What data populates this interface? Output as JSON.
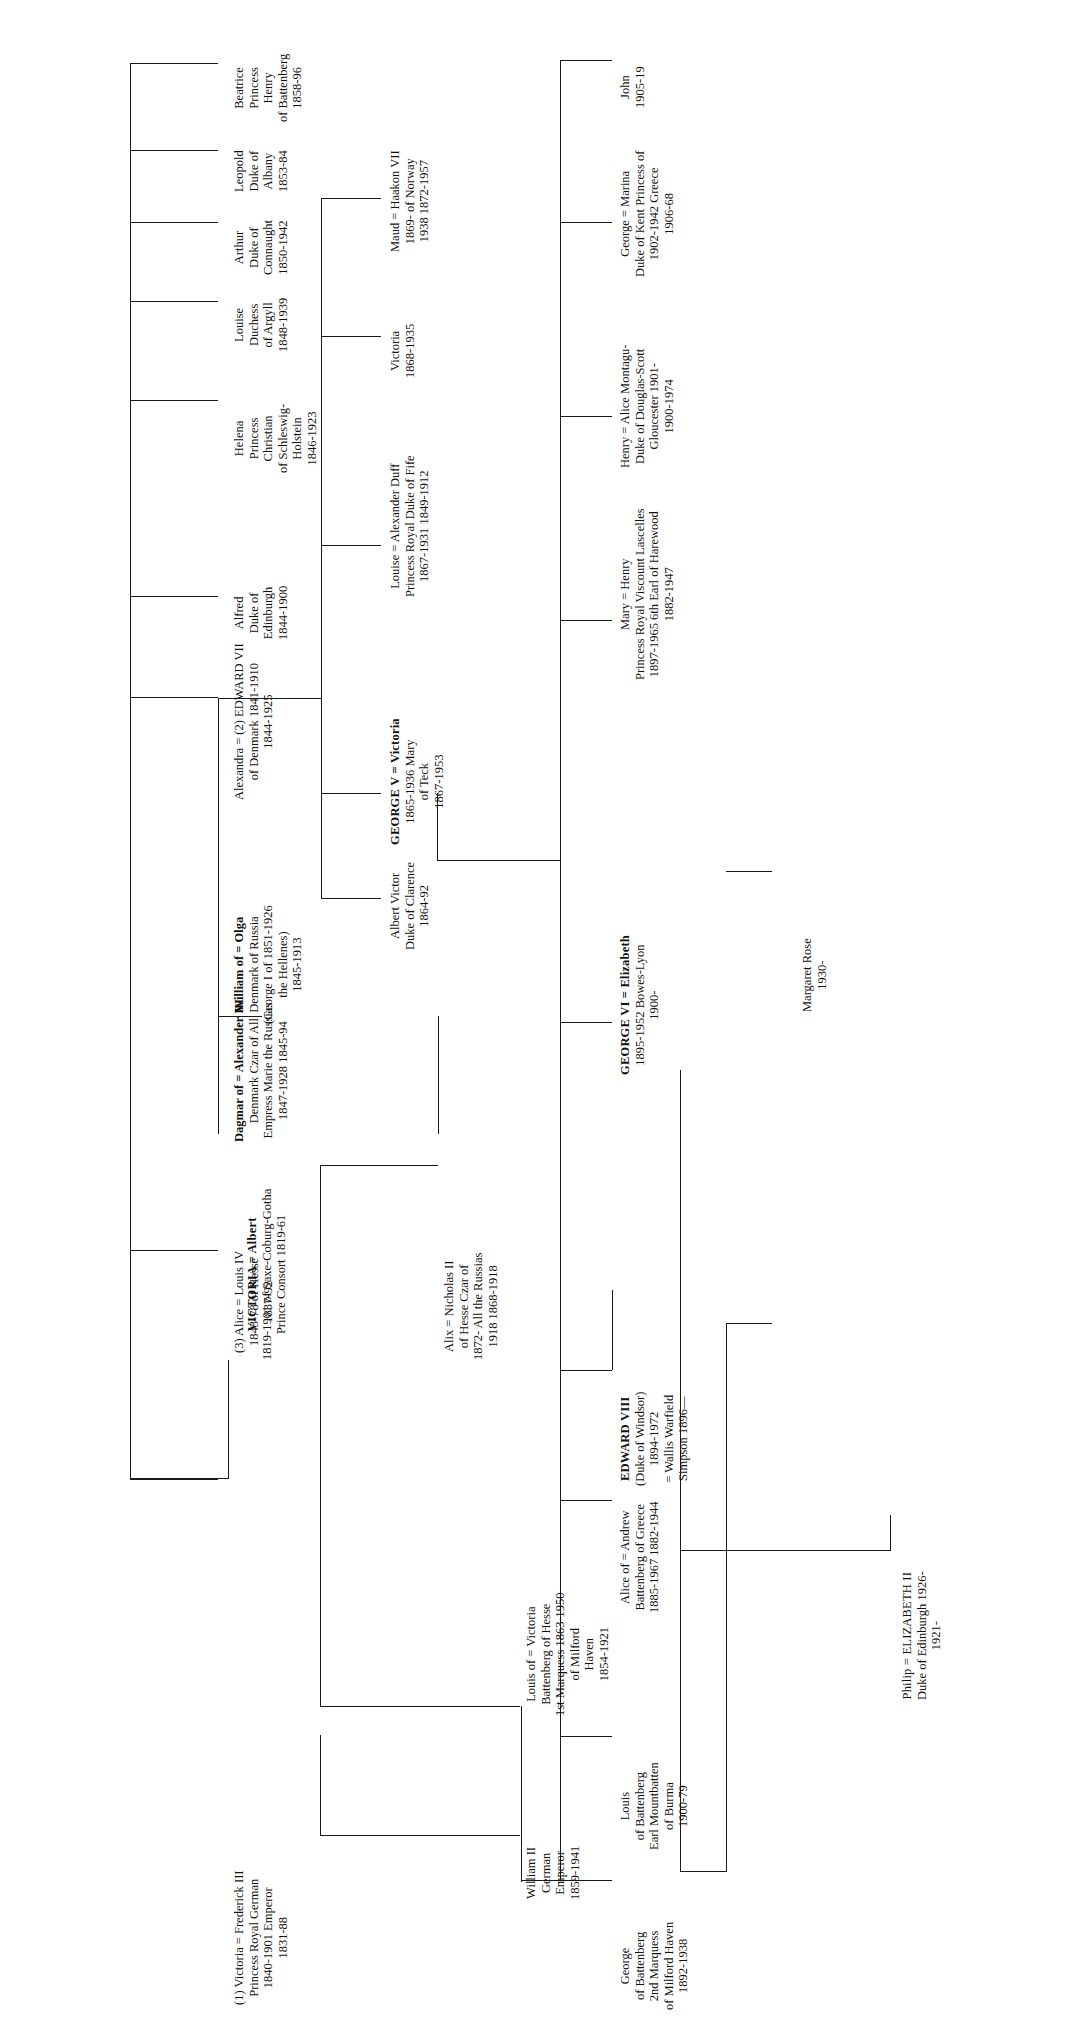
{
  "chart": {
    "orientation": "rotated-90-ccw",
    "line_color": "#1a1a1a"
  },
  "root": {
    "name": "root-couple",
    "lines": [
      "VICTORIA  =  Albert",
      "1819-1901    of Saxe-Coburg-Gotha",
      "Prince Consort 1819-61"
    ],
    "l1": "VICTORIA  =  Albert",
    "l2": "1819-1901     of Saxe-Coburg-Gotha",
    "l3": "Prince Consort 1819-61"
  },
  "generation2": [
    {
      "name": "victoria-princess-royal",
      "l1": "(1) Victoria  =  Frederick III",
      "l2": "Princess Royal     German",
      "l3": "1840-1901       Emperor",
      "l4": "1831-88"
    },
    {
      "name": "alice-of-hesse",
      "l1": "(3) Alice  =  Louis IV",
      "l2": "1843-78       of Hesse",
      "l3": "1837-92"
    },
    {
      "name": "edward-vii",
      "l1": "Alexandra  =  (2) EDWARD VII",
      "l2": "of Denmark          1841-1910",
      "l3": "1844-1925"
    },
    {
      "name": "alfred-duke-of-edinburgh",
      "l1": "Alfred",
      "l2": "Duke of",
      "l3": "Edinburgh",
      "l4": "1844-1900"
    },
    {
      "name": "helena-princess-christian",
      "l1": "Helena",
      "l2": "Princess",
      "l3": "Christian",
      "l4": "of Schleswig-",
      "l5": "Holstein",
      "l6": "1846-1923"
    },
    {
      "name": "louise-duchess-of-argyll",
      "l1": "Louise",
      "l2": "Duchess",
      "l3": "of Argyll",
      "l4": "1848-1939"
    },
    {
      "name": "arthur-duke-of-connaught",
      "l1": "Arthur",
      "l2": "Duke of",
      "l3": "Connaught",
      "l4": "1850-1942"
    },
    {
      "name": "leopold-duke-of-albany",
      "l1": "Leopold",
      "l2": "Duke of",
      "l3": "Albany",
      "l4": "1853-84"
    },
    {
      "name": "beatrice",
      "l1": "Beatrice",
      "l2": "Princess",
      "l3": "Henry",
      "l4": "of Battenberg",
      "l5": "1858-96"
    }
  ],
  "generation3": [
    {
      "name": "william-ii-german-emperor",
      "l1": "William II",
      "l2": "German",
      "l3": "Emperor",
      "l4": "1859-1941"
    },
    {
      "name": "louis-of-battenberg",
      "l1": "Louis of  =  Victoria",
      "l2": "Battenberg      of Hesse",
      "l3": "1st Marquess    1863-1950",
      "l4": "of Milford",
      "l5": "Haven",
      "l6": "1854-1921"
    },
    {
      "name": "alix-of-hesse",
      "l1": "Alix  =  Nicholas II",
      "l2": "of Hesse      Czar of",
      "l3": "1872-     All the Russias",
      "l4": "1918       1868-1918"
    },
    {
      "name": "dagmar-of-denmark",
      "l1": "Dagmar of  =  Alexander III",
      "l2": "Denmark        Czar of All",
      "l3": "Empress Marie   the Russias",
      "l4": "1847-1928        1845-94"
    },
    {
      "name": "william-of-denmark-george-i",
      "l1": "William of  =  Olga",
      "l2": "Denmark        of Russia",
      "l3": "(George I of    1851-1926",
      "l4": "the Hellenes)",
      "l5": "1845-1913"
    },
    {
      "name": "albert-victor-duke-of-clarence",
      "l1": "Albert Victor",
      "l2": "Duke of Clarence",
      "l3": "1864-92"
    },
    {
      "name": "george-v",
      "l1": "GEORGE V  =  Victoria",
      "l2": "1865-1936           Mary",
      "l3": "of Teck",
      "l4": "1867-1953"
    },
    {
      "name": "louise-princess-royal",
      "l1": "Louise  =  Alexander Duff",
      "l2": "Princess Royal    Duke of Fife",
      "l3": "1867-1931          1849-1912"
    },
    {
      "name": "victoria-1868",
      "l1": "Victoria",
      "l2": "1868-1935"
    },
    {
      "name": "maud-of-norway",
      "l1": "Maud  =  Haakon VII",
      "l2": "1869-       of Norway",
      "l3": "1938      1872-1957"
    }
  ],
  "generation4": [
    {
      "name": "george-of-battenberg",
      "l1": "George",
      "l2": "of Battenberg",
      "l3": "2nd Marquess",
      "l4": "of Milford Haven",
      "l5": "1892-1938"
    },
    {
      "name": "louis-mountbatten",
      "l1": "Louis",
      "l2": "of Battenberg",
      "l3": "Earl Mountbatten",
      "l4": "of Burma",
      "l5": "1900-79"
    },
    {
      "name": "alice-of-battenberg",
      "l1": "Alice of  =  Andrew",
      "l2": "Battenberg      of Greece",
      "l3": "1885-1967      1882-1944"
    },
    {
      "name": "edward-viii",
      "l1": "EDWARD VIII",
      "l2": "(Duke of Windsor)",
      "l3": "1894-1972",
      "l4": "= Wallis Warfield",
      "l5": "Simpson 1896—"
    },
    {
      "name": "george-vi",
      "l1": "GEORGE VI  =  Elizabeth",
      "l2": "1895-1952          Bowes-Lyon",
      "l3": "1900-"
    },
    {
      "name": "mary-princess-royal",
      "l1": "Mary  =  Henry",
      "l2": "Princess Royal    Viscount Lascelles",
      "l3": "1897-1965       6th Earl of Harewood",
      "l4": "1882-1947"
    },
    {
      "name": "henry-duke-of-gloucester",
      "l1": "Henry  =  Alice Montagu-",
      "l2": "Duke of        Douglas-Scott",
      "l3": "Gloucester       1901-",
      "l4": "1900-1974"
    },
    {
      "name": "george-duke-of-kent",
      "l1": "George  =  Marina",
      "l2": "Duke of Kent    Princess of",
      "l3": "1902-1942       Greece",
      "l4": "1906-68"
    },
    {
      "name": "john-1905",
      "l1": "John",
      "l2": "1905-19"
    }
  ],
  "generation5": [
    {
      "name": "elizabeth-ii",
      "l1": "Philip  =  ELIZABETH II",
      "l2": "Duke of Edinburgh    1926-",
      "l3": "1921-"
    },
    {
      "name": "margaret-rose",
      "l1": "Margaret Rose",
      "l2": "1930-"
    }
  ]
}
